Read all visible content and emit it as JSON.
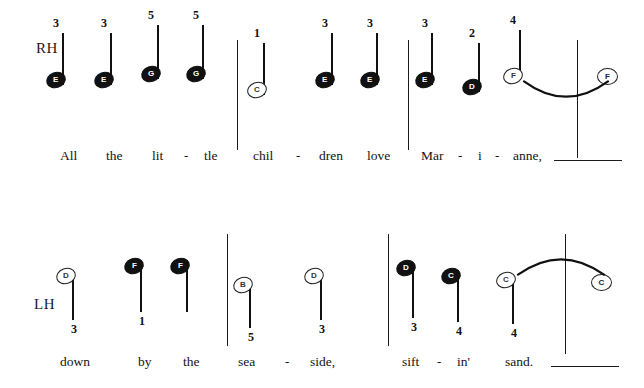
{
  "page": {
    "width": 644,
    "height": 388,
    "background": "#ffffff",
    "ink": "#111111",
    "title_visible": false
  },
  "systems": [
    {
      "id": "system-rh",
      "hand_label": "RH",
      "hand_label_x": 36,
      "hand_label_y": 40,
      "notes": [
        {
          "letter": "E",
          "head": "filled",
          "finger": "3",
          "finger_pos": "above",
          "x": 62,
          "stem_top": 33,
          "stem_bottom": 85,
          "head_y": 72,
          "stem_side": "left"
        },
        {
          "letter": "E",
          "head": "filled",
          "finger": "3",
          "finger_pos": "above",
          "x": 110,
          "stem_top": 33,
          "stem_bottom": 85,
          "head_y": 72,
          "stem_side": "left"
        },
        {
          "letter": "G",
          "head": "filled",
          "finger": "5",
          "finger_pos": "above",
          "x": 157,
          "stem_top": 25,
          "stem_bottom": 79,
          "head_y": 66,
          "stem_side": "left"
        },
        {
          "letter": "G",
          "head": "filled",
          "finger": "5",
          "finger_pos": "above",
          "x": 202,
          "stem_top": 25,
          "stem_bottom": 79,
          "head_y": 66,
          "stem_side": "left"
        },
        {
          "letter": "C",
          "head": "open",
          "finger": "1",
          "finger_pos": "above",
          "x": 263,
          "stem_top": 43,
          "stem_bottom": 95,
          "head_y": 82,
          "stem_side": "left"
        },
        {
          "letter": "E",
          "head": "filled",
          "finger": "3",
          "finger_pos": "above",
          "x": 331,
          "stem_top": 33,
          "stem_bottom": 85,
          "head_y": 72,
          "stem_side": "left"
        },
        {
          "letter": "E",
          "head": "filled",
          "finger": "3",
          "finger_pos": "above",
          "x": 376,
          "stem_top": 33,
          "stem_bottom": 85,
          "head_y": 72,
          "stem_side": "left"
        },
        {
          "letter": "E",
          "head": "filled",
          "finger": "3",
          "finger_pos": "above",
          "x": 431,
          "stem_top": 33,
          "stem_bottom": 85,
          "head_y": 72,
          "stem_side": "left"
        },
        {
          "letter": "D",
          "head": "filled",
          "finger": "2",
          "finger_pos": "above",
          "x": 478,
          "stem_top": 43,
          "stem_bottom": 92,
          "head_y": 79,
          "stem_side": "left"
        },
        {
          "letter": "F",
          "head": "open",
          "finger": "4",
          "finger_pos": "above",
          "x": 519,
          "stem_top": 30,
          "stem_bottom": 80,
          "head_y": 68,
          "stem_side": "left"
        },
        {
          "letter": "F",
          "head": "whole",
          "finger": "",
          "finger_pos": "none",
          "x": 606,
          "stem_top": 0,
          "stem_bottom": 0,
          "head_y": 68,
          "stem_side": "none"
        }
      ],
      "barlines": [
        {
          "x": 237,
          "y": 40,
          "height": 110
        },
        {
          "x": 408,
          "y": 40,
          "height": 110
        },
        {
          "x": 577,
          "y": 40,
          "height": 118
        }
      ],
      "ties": [
        {
          "x": 524,
          "y": 78,
          "width": 84,
          "height": 22,
          "direction": "down"
        }
      ],
      "lyrics": [
        {
          "text": "All",
          "x": 60,
          "y": 148
        },
        {
          "text": "the",
          "x": 106,
          "y": 148
        },
        {
          "text": "lit",
          "x": 152,
          "y": 148
        },
        {
          "text": "-",
          "x": 184,
          "y": 148
        },
        {
          "text": "tle",
          "x": 204,
          "y": 148
        },
        {
          "text": "chil",
          "x": 253,
          "y": 148
        },
        {
          "text": "-",
          "x": 296,
          "y": 148
        },
        {
          "text": "dren",
          "x": 319,
          "y": 148
        },
        {
          "text": "love",
          "x": 367,
          "y": 148
        },
        {
          "text": "Mar",
          "x": 421,
          "y": 148
        },
        {
          "text": "-",
          "x": 458,
          "y": 148
        },
        {
          "text": "i",
          "x": 478,
          "y": 148
        },
        {
          "text": "-",
          "x": 495,
          "y": 148
        },
        {
          "text": "anne,",
          "x": 513,
          "y": 148
        }
      ],
      "extenders": [
        {
          "x": 554,
          "y": 160,
          "width": 68
        }
      ]
    },
    {
      "id": "system-lh",
      "hand_label": "LH",
      "hand_label_x": 34,
      "hand_label_y": 102,
      "notes": [
        {
          "letter": "D",
          "head": "open",
          "finger": "3",
          "finger_pos": "below",
          "x": 72,
          "stem_top": 80,
          "stem_bottom": 126,
          "head_y": 74,
          "stem_side": "left"
        },
        {
          "letter": "F",
          "head": "filled",
          "finger": "1",
          "finger_pos": "below",
          "x": 140,
          "stem_top": 72,
          "stem_bottom": 118,
          "head_y": 64,
          "stem_side": "left"
        },
        {
          "letter": "F",
          "head": "filled",
          "finger": "",
          "finger_pos": "none",
          "x": 186,
          "stem_top": 72,
          "stem_bottom": 118,
          "head_y": 64,
          "stem_side": "left"
        },
        {
          "letter": "B",
          "head": "open",
          "finger": "5",
          "finger_pos": "below",
          "x": 249,
          "stem_top": 89,
          "stem_bottom": 134,
          "head_y": 83,
          "stem_side": "left"
        },
        {
          "letter": "D",
          "head": "open",
          "finger": "3",
          "finger_pos": "below",
          "x": 320,
          "stem_top": 80,
          "stem_bottom": 126,
          "head_y": 74,
          "stem_side": "left"
        },
        {
          "letter": "D",
          "head": "filled",
          "finger": "3",
          "finger_pos": "below",
          "x": 412,
          "stem_top": 74,
          "stem_bottom": 124,
          "head_y": 66,
          "stem_side": "left"
        },
        {
          "letter": "C",
          "head": "filled",
          "finger": "4",
          "finger_pos": "below",
          "x": 457,
          "stem_top": 82,
          "stem_bottom": 128,
          "head_y": 74,
          "stem_side": "left"
        },
        {
          "letter": "C",
          "head": "open",
          "finger": "4",
          "finger_pos": "below",
          "x": 512,
          "stem_top": 84,
          "stem_bottom": 130,
          "head_y": 78,
          "stem_side": "left"
        },
        {
          "letter": "C",
          "head": "whole",
          "finger": "",
          "finger_pos": "none",
          "x": 600,
          "stem_top": 0,
          "stem_bottom": 0,
          "head_y": 80,
          "stem_side": "none"
        }
      ],
      "barlines": [
        {
          "x": 227,
          "y": 40,
          "height": 112
        },
        {
          "x": 388,
          "y": 40,
          "height": 112
        },
        {
          "x": 565,
          "y": 40,
          "height": 120
        }
      ],
      "ties": [
        {
          "x": 518,
          "y": 62,
          "width": 86,
          "height": 22,
          "direction": "up"
        }
      ],
      "lyrics": [
        {
          "text": "down",
          "x": 60,
          "y": 160
        },
        {
          "text": "by",
          "x": 138,
          "y": 160
        },
        {
          "text": "the",
          "x": 183,
          "y": 160
        },
        {
          "text": "sea",
          "x": 238,
          "y": 160
        },
        {
          "text": "-",
          "x": 285,
          "y": 160
        },
        {
          "text": "side,",
          "x": 310,
          "y": 160
        },
        {
          "text": "sift",
          "x": 402,
          "y": 160
        },
        {
          "text": "-",
          "x": 437,
          "y": 160
        },
        {
          "text": "in'",
          "x": 457,
          "y": 160
        },
        {
          "text": "sand.",
          "x": 505,
          "y": 160
        }
      ],
      "extenders": [
        {
          "x": 551,
          "y": 172,
          "width": 68
        }
      ]
    }
  ]
}
